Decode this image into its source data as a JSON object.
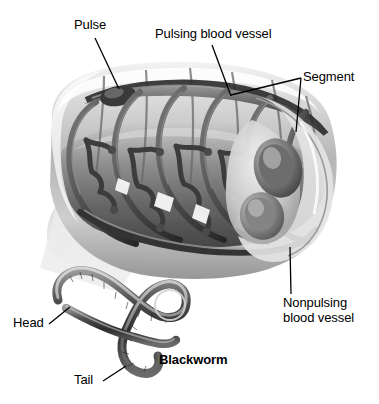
{
  "figure": {
    "kind": "anatomical-illustration",
    "style": "grayscale cutaway 3D rendering with photographic specimen inset",
    "background_color": "#ffffff",
    "ink_color": "#000000"
  },
  "labels": {
    "pulse": "Pulse",
    "pulsing_vessel": "Pulsing blood vessel",
    "segment": "Segment",
    "nonpulsing_vessel_line1": "Nonpulsing",
    "nonpulsing_vessel_line2": "blood vessel",
    "head": "Head",
    "tail": "Tail",
    "organism": "Blackworm"
  },
  "palette": {
    "body_light": "#e9e9e9",
    "body_mid": "#b9b9b9",
    "body_dark": "#6f6f6f",
    "vessel_dark": "#4a4a4a",
    "vessel_darker": "#2e2e2e",
    "shadow": "#cfcfcf",
    "worm_dark": "#3a3a3a",
    "worm_mid": "#7a7a7a"
  },
  "parts": {
    "cutaway_tube": "segmented worm body shown in cutaway perspective",
    "segment_count": 6,
    "ring_vessel_count": 6,
    "branch_clusters": 5,
    "cross_section_openings": 2,
    "specimen": "curved S-shaped blackworm photograph"
  }
}
